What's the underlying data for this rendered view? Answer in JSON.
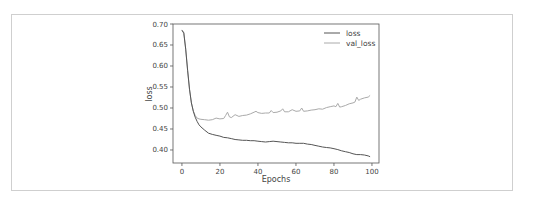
{
  "chart_data": {
    "type": "line",
    "title": "",
    "xlabel": "Epochs",
    "ylabel": "loss",
    "xlim": [
      -4.7,
      103.7
    ],
    "ylim": [
      0.369,
      0.7
    ],
    "xticks": [
      0,
      20,
      40,
      60,
      80,
      100
    ],
    "yticks": [
      0.4,
      0.45,
      0.5,
      0.55,
      0.6,
      0.65,
      0.7
    ],
    "xtick_labels": [
      "0",
      "20",
      "40",
      "60",
      "80",
      "100"
    ],
    "ytick_labels": [
      "0.40",
      "0.45",
      "0.50",
      "0.55",
      "0.60",
      "0.65",
      "0.70"
    ],
    "grid": false,
    "legend_position": "upper right",
    "series": [
      {
        "name": "loss",
        "color": "#555555",
        "x": [
          0,
          1,
          2,
          3,
          4,
          5,
          6,
          7,
          8,
          9,
          10,
          12,
          14,
          16,
          18,
          20,
          22,
          24,
          26,
          28,
          30,
          32,
          34,
          36,
          38,
          40,
          42,
          44,
          46,
          48,
          50,
          52,
          54,
          56,
          58,
          60,
          62,
          64,
          66,
          68,
          70,
          72,
          74,
          76,
          78,
          80,
          82,
          84,
          86,
          88,
          90,
          92,
          94,
          96,
          98,
          99
        ],
        "values": [
          0.685,
          0.678,
          0.64,
          0.59,
          0.545,
          0.512,
          0.492,
          0.478,
          0.468,
          0.46,
          0.455,
          0.447,
          0.44,
          0.437,
          0.435,
          0.433,
          0.43,
          0.429,
          0.427,
          0.425,
          0.424,
          0.423,
          0.423,
          0.422,
          0.422,
          0.421,
          0.42,
          0.419,
          0.42,
          0.421,
          0.42,
          0.419,
          0.418,
          0.417,
          0.417,
          0.416,
          0.416,
          0.416,
          0.414,
          0.413,
          0.411,
          0.409,
          0.407,
          0.406,
          0.405,
          0.403,
          0.401,
          0.398,
          0.396,
          0.394,
          0.391,
          0.389,
          0.389,
          0.388,
          0.386,
          0.384
        ]
      },
      {
        "name": "val_loss",
        "legend_label": "val_loss",
        "color": "#aaaaaa",
        "x": [
          0,
          1,
          2,
          3,
          4,
          5,
          6,
          7,
          8,
          9,
          10,
          12,
          14,
          16,
          18,
          20,
          22,
          23,
          24,
          25,
          26,
          28,
          30,
          32,
          34,
          36,
          38,
          39,
          40,
          42,
          44,
          46,
          47,
          48,
          50,
          52,
          53,
          54,
          56,
          58,
          60,
          62,
          63,
          64,
          66,
          68,
          70,
          72,
          74,
          76,
          78,
          80,
          81,
          82,
          83,
          84,
          86,
          88,
          90,
          91,
          92,
          93,
          94,
          96,
          98,
          99
        ],
        "values": [
          0.686,
          0.68,
          0.641,
          0.59,
          0.544,
          0.512,
          0.493,
          0.482,
          0.476,
          0.474,
          0.473,
          0.472,
          0.471,
          0.472,
          0.476,
          0.474,
          0.475,
          0.482,
          0.49,
          0.479,
          0.477,
          0.484,
          0.48,
          0.482,
          0.483,
          0.486,
          0.49,
          0.492,
          0.489,
          0.487,
          0.488,
          0.488,
          0.494,
          0.489,
          0.49,
          0.493,
          0.498,
          0.491,
          0.491,
          0.496,
          0.492,
          0.493,
          0.5,
          0.492,
          0.493,
          0.495,
          0.496,
          0.498,
          0.497,
          0.501,
          0.503,
          0.505,
          0.503,
          0.511,
          0.502,
          0.503,
          0.506,
          0.51,
          0.512,
          0.514,
          0.526,
          0.518,
          0.521,
          0.524,
          0.526,
          0.53
        ]
      }
    ]
  }
}
